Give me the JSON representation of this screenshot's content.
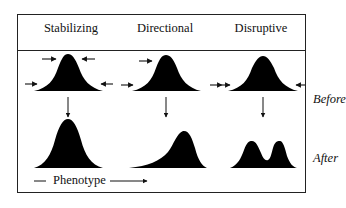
{
  "columns": [
    {
      "label": "Stabilizing"
    },
    {
      "label": "Directional"
    },
    {
      "label": "Disruptive"
    }
  ],
  "rows": [
    {
      "label": "Before"
    },
    {
      "label": "After"
    }
  ],
  "axis": {
    "label": "Phenotype"
  },
  "colors": {
    "curve_fill": "#000000",
    "border": "#222222",
    "background": "#ffffff"
  }
}
